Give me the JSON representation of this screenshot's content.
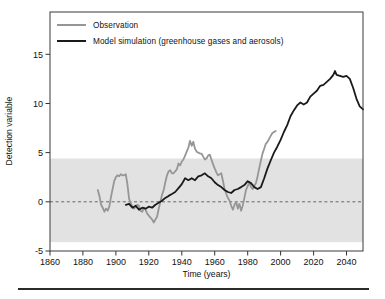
{
  "figure": {
    "y_axis_label": "Detection variable",
    "x_axis_label": "Time (years)",
    "legend": [
      {
        "label": "Observation",
        "color": "#969696"
      },
      {
        "label": "Model simulation (greenhouse gases and aerosols)",
        "color": "#1a1a1a"
      }
    ]
  },
  "colors": {
    "background": "#ffffff",
    "plot_frame": "#3a3a3a",
    "shaded_band": "#e2e2e2",
    "zero_line": "#5a5a5a",
    "separator_rule": "#2b2b2b"
  },
  "chart_data": {
    "type": "line",
    "title": "",
    "xlabel": "Time (years)",
    "ylabel": "Detection variable",
    "xlim": [
      1860,
      2050
    ],
    "ylim": [
      -5,
      19.3
    ],
    "x_ticks": [
      1860,
      1880,
      1900,
      1920,
      1940,
      1960,
      1980,
      2000,
      2020,
      2040
    ],
    "y_ticks": [
      -5,
      0,
      5,
      10,
      15
    ],
    "grid": false,
    "legend_position": "top-left",
    "zero_line": {
      "y": 0,
      "style": "dashed"
    },
    "shaded_band": {
      "from": -4.1,
      "to": 4.4,
      "color": "#e2e2e2"
    },
    "series": [
      {
        "name": "Observation",
        "dom_name": "observation-line",
        "color": "#969696",
        "width": 1.8,
        "points": [
          [
            1889,
            1.2
          ],
          [
            1890,
            0.6
          ],
          [
            1891,
            -0.3
          ],
          [
            1892,
            -0.6
          ],
          [
            1893,
            -1.0
          ],
          [
            1894,
            -0.7
          ],
          [
            1895,
            -0.9
          ],
          [
            1896,
            -0.5
          ],
          [
            1897,
            0.5
          ],
          [
            1898,
            1.3
          ],
          [
            1899,
            2.1
          ],
          [
            1900,
            2.5
          ],
          [
            1901,
            2.7
          ],
          [
            1902,
            2.6
          ],
          [
            1903,
            2.8
          ],
          [
            1904,
            2.7
          ],
          [
            1905,
            2.7
          ],
          [
            1906,
            2.8
          ],
          [
            1907,
            1.8
          ],
          [
            1908,
            0.3
          ],
          [
            1909,
            -0.1
          ],
          [
            1910,
            -0.5
          ],
          [
            1911,
            -0.7
          ],
          [
            1912,
            -0.5
          ],
          [
            1913,
            -0.3
          ],
          [
            1914,
            -0.4
          ],
          [
            1915,
            -0.9
          ],
          [
            1916,
            -1.0
          ],
          [
            1917,
            -0.6
          ],
          [
            1918,
            -0.8
          ],
          [
            1919,
            -1.2
          ],
          [
            1920,
            -1.4
          ],
          [
            1921,
            -1.6
          ],
          [
            1922,
            -1.8
          ],
          [
            1923,
            -2.1
          ],
          [
            1924,
            -1.8
          ],
          [
            1925,
            -1.5
          ],
          [
            1926,
            -0.7
          ],
          [
            1927,
            0.0
          ],
          [
            1928,
            0.7
          ],
          [
            1929,
            1.2
          ],
          [
            1930,
            2.0
          ],
          [
            1931,
            2.7
          ],
          [
            1932,
            3.1
          ],
          [
            1933,
            3.2
          ],
          [
            1934,
            2.9
          ],
          [
            1935,
            2.9
          ],
          [
            1936,
            3.1
          ],
          [
            1937,
            3.3
          ],
          [
            1938,
            3.9
          ],
          [
            1939,
            3.7
          ],
          [
            1940,
            4.1
          ],
          [
            1941,
            4.3
          ],
          [
            1942,
            4.7
          ],
          [
            1943,
            5.1
          ],
          [
            1944,
            5.5
          ],
          [
            1945,
            6.2
          ],
          [
            1946,
            5.7
          ],
          [
            1947,
            6.1
          ],
          [
            1948,
            5.4
          ],
          [
            1949,
            5.1
          ],
          [
            1950,
            5.0
          ],
          [
            1951,
            4.9
          ],
          [
            1952,
            4.9
          ],
          [
            1953,
            4.6
          ],
          [
            1954,
            4.3
          ],
          [
            1955,
            4.4
          ],
          [
            1956,
            4.7
          ],
          [
            1957,
            4.8
          ],
          [
            1958,
            4.3
          ],
          [
            1959,
            3.8
          ],
          [
            1960,
            3.4
          ],
          [
            1961,
            3.0
          ],
          [
            1962,
            2.7
          ],
          [
            1963,
            2.8
          ],
          [
            1964,
            2.9
          ],
          [
            1965,
            2.1
          ],
          [
            1966,
            1.3
          ],
          [
            1967,
            0.8
          ],
          [
            1968,
            0.4
          ],
          [
            1969,
            0.1
          ],
          [
            1970,
            -0.4
          ],
          [
            1971,
            -0.8
          ],
          [
            1972,
            -0.3
          ],
          [
            1973,
            0.0
          ],
          [
            1974,
            -0.7
          ],
          [
            1975,
            -0.2
          ],
          [
            1976,
            -0.9
          ],
          [
            1977,
            -0.4
          ],
          [
            1978,
            0.4
          ],
          [
            1979,
            1.2
          ],
          [
            1980,
            1.6
          ],
          [
            1981,
            2.0
          ],
          [
            1982,
            1.5
          ],
          [
            1983,
            1.3
          ],
          [
            1984,
            1.6
          ],
          [
            1985,
            1.9
          ],
          [
            1986,
            2.6
          ],
          [
            1987,
            3.4
          ],
          [
            1988,
            4.2
          ],
          [
            1989,
            4.9
          ],
          [
            1990,
            5.4
          ],
          [
            1991,
            5.9
          ],
          [
            1992,
            6.1
          ],
          [
            1993,
            6.4
          ],
          [
            1994,
            6.7
          ],
          [
            1995,
            7.0
          ],
          [
            1996,
            7.1
          ],
          [
            1997,
            7.2
          ]
        ]
      },
      {
        "name": "Model simulation (greenhouse gases and aerosols)",
        "dom_name": "model-simulation-line",
        "color": "#1a1a1a",
        "width": 1.8,
        "points": [
          [
            1906,
            -0.3
          ],
          [
            1908,
            -0.2
          ],
          [
            1910,
            -0.6
          ],
          [
            1912,
            -0.4
          ],
          [
            1914,
            -0.8
          ],
          [
            1916,
            -0.6
          ],
          [
            1918,
            -0.7
          ],
          [
            1920,
            -0.5
          ],
          [
            1922,
            -0.6
          ],
          [
            1924,
            -0.3
          ],
          [
            1926,
            -0.1
          ],
          [
            1928,
            0.1
          ],
          [
            1930,
            0.4
          ],
          [
            1932,
            0.6
          ],
          [
            1934,
            0.8
          ],
          [
            1936,
            1.0
          ],
          [
            1938,
            1.4
          ],
          [
            1940,
            1.8
          ],
          [
            1942,
            2.4
          ],
          [
            1944,
            2.2
          ],
          [
            1946,
            2.4
          ],
          [
            1948,
            2.2
          ],
          [
            1950,
            2.6
          ],
          [
            1952,
            2.7
          ],
          [
            1954,
            2.9
          ],
          [
            1956,
            2.6
          ],
          [
            1958,
            2.4
          ],
          [
            1960,
            2.0
          ],
          [
            1962,
            1.7
          ],
          [
            1964,
            1.5
          ],
          [
            1966,
            1.2
          ],
          [
            1968,
            1.0
          ],
          [
            1970,
            0.9
          ],
          [
            1972,
            1.2
          ],
          [
            1974,
            1.3
          ],
          [
            1976,
            1.5
          ],
          [
            1978,
            1.7
          ],
          [
            1980,
            2.1
          ],
          [
            1982,
            1.9
          ],
          [
            1984,
            1.5
          ],
          [
            1986,
            1.3
          ],
          [
            1988,
            1.5
          ],
          [
            1990,
            2.4
          ],
          [
            1992,
            3.4
          ],
          [
            1994,
            4.2
          ],
          [
            1996,
            5.0
          ],
          [
            1998,
            5.6
          ],
          [
            2000,
            6.3
          ],
          [
            2002,
            7.1
          ],
          [
            2004,
            7.8
          ],
          [
            2006,
            8.7
          ],
          [
            2008,
            9.3
          ],
          [
            2010,
            9.8
          ],
          [
            2012,
            10.1
          ],
          [
            2014,
            9.9
          ],
          [
            2016,
            10.1
          ],
          [
            2018,
            10.7
          ],
          [
            2020,
            11.0
          ],
          [
            2022,
            11.3
          ],
          [
            2024,
            11.8
          ],
          [
            2026,
            11.9
          ],
          [
            2028,
            12.2
          ],
          [
            2030,
            12.5
          ],
          [
            2032,
            12.9
          ],
          [
            2033,
            13.3
          ],
          [
            2034,
            12.9
          ],
          [
            2036,
            12.8
          ],
          [
            2038,
            12.7
          ],
          [
            2040,
            12.8
          ],
          [
            2042,
            12.5
          ],
          [
            2044,
            11.6
          ],
          [
            2046,
            10.5
          ],
          [
            2048,
            9.7
          ],
          [
            2050,
            9.4
          ]
        ]
      }
    ]
  }
}
